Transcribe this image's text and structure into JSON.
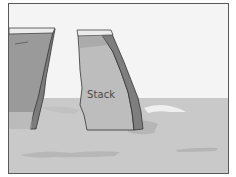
{
  "diagram": {
    "type": "coastal-landform-illustration",
    "labels": {
      "stack": "Stack"
    },
    "elements": [
      {
        "name": "sky",
        "description": "pale sky background"
      },
      {
        "name": "mainland-cliff",
        "description": "cliff face on left edge"
      },
      {
        "name": "sea-stack",
        "description": "isolated rock column labeled Stack"
      },
      {
        "name": "sea",
        "description": "grey sea surface with ripples"
      },
      {
        "name": "wave-foam",
        "description": "white foam right of the stack"
      }
    ],
    "colors": {
      "frame": "#5a5a5a",
      "sky": "#f4f4f4",
      "sea": "#c9c9c9",
      "cliff_face": "#9a9a9a",
      "cliff_shadow": "#7c7c7c",
      "stack_face": "#bdbdbd",
      "cap": "#ececec",
      "outline": "#333333",
      "foam": "#efefef",
      "ripple": "#b0b0b0"
    }
  }
}
